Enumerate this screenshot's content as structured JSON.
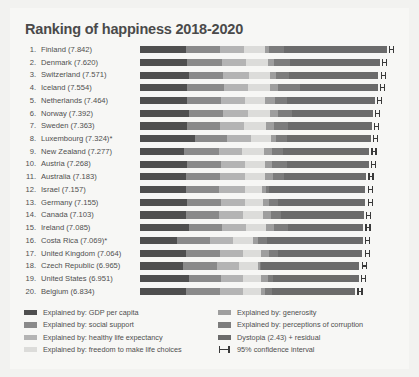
{
  "chart": {
    "title": "Ranking of happiness 2018-2020"
  },
  "chart_data": {
    "type": "bar",
    "subtype": "stacked-horizontal",
    "title": "Ranking of happiness 2018-2020",
    "xlabel": "",
    "ylabel": "",
    "xlim": [
      0,
      8.2
    ],
    "grid": false,
    "legend_position": "bottom",
    "categories": [
      "Finland",
      "Denmark",
      "Switzerland",
      "Iceland",
      "Netherlands",
      "Norway",
      "Sweden",
      "Luxembourg",
      "New Zealand",
      "Austria",
      "Australia",
      "Israel",
      "Germany",
      "Canada",
      "Ireland",
      "Costa Rica",
      "United Kingdom",
      "Czech Republic",
      "United States",
      "Belgium"
    ],
    "ranks": [
      1,
      2,
      3,
      4,
      5,
      6,
      7,
      8,
      9,
      10,
      11,
      12,
      13,
      14,
      15,
      16,
      17,
      18,
      19,
      20
    ],
    "row_labels": [
      "Finland (7.842)",
      "Denmark (7.620)",
      "Switzerland (7.571)",
      "Iceland (7.554)",
      "Netherlands (7.464)",
      "Norway (7.392)",
      "Sweden (7.363)",
      "Luxembourg (7.324)*",
      "New Zealand (7.277)",
      "Austria (7.268)",
      "Australia (7.183)",
      "Israel (7.157)",
      "Germany (7.155)",
      "Canada (7.103)",
      "Ireland (7.085)",
      "Costa Rica (7.069)*",
      "United Kingdom (7.064)",
      "Czech Republic (6.965)",
      "United States (6.951)",
      "Belgium (6.834)"
    ],
    "totals": [
      7.842,
      7.62,
      7.571,
      7.554,
      7.464,
      7.392,
      7.363,
      7.324,
      7.277,
      7.268,
      7.183,
      7.157,
      7.155,
      7.103,
      7.085,
      7.069,
      7.064,
      6.965,
      6.951,
      6.834
    ],
    "series": [
      {
        "name": "Explained by: GDP per capita",
        "color": "#4f4f4f",
        "values": [
          1.446,
          1.502,
          1.566,
          1.482,
          1.501,
          1.543,
          1.478,
          1.751,
          1.4,
          1.492,
          1.459,
          1.46,
          1.5,
          1.447,
          1.55,
          1.162,
          1.459,
          1.352,
          1.54,
          1.457
        ]
      },
      {
        "name": "Explained by: social support",
        "color": "#8a8a8a",
        "values": [
          1.106,
          1.108,
          1.079,
          1.172,
          1.079,
          1.108,
          1.062,
          1.003,
          1.094,
          1.07,
          1.095,
          1.061,
          1.067,
          1.064,
          1.066,
          1.066,
          1.07,
          1.089,
          1.047,
          1.07
        ]
      },
      {
        "name": "Explained by: healthy life expectancy",
        "color": "#b4b4b4",
        "values": [
          0.741,
          0.763,
          0.816,
          0.772,
          0.753,
          0.782,
          0.763,
          0.76,
          0.758,
          0.759,
          0.771,
          0.8,
          0.764,
          0.763,
          0.752,
          0.722,
          0.748,
          0.717,
          0.697,
          0.755
        ]
      },
      {
        "name": "Explained by: freedom to make life choices",
        "color": "#dcdcda",
        "values": [
          0.691,
          0.686,
          0.653,
          0.698,
          0.647,
          0.703,
          0.685,
          0.639,
          0.68,
          0.638,
          0.651,
          0.567,
          0.586,
          0.632,
          0.629,
          0.65,
          0.55,
          0.582,
          0.546,
          0.565
        ]
      },
      {
        "name": "Explained by: generosity",
        "color": "#9e9e9e",
        "values": [
          0.124,
          0.208,
          0.204,
          0.25,
          0.302,
          0.249,
          0.258,
          0.166,
          0.245,
          0.242,
          0.261,
          0.119,
          0.18,
          0.244,
          0.269,
          0.144,
          0.27,
          0.064,
          0.221,
          0.123
        ]
      },
      {
        "name": "Explained by: perceptions of corruption",
        "color": "#7c7c7c",
        "values": [
          0.481,
          0.485,
          0.413,
          0.718,
          0.384,
          0.427,
          0.448,
          0.353,
          0.361,
          0.481,
          0.343,
          0.098,
          0.273,
          0.322,
          0.427,
          0.294,
          0.285,
          0.038,
          0.169,
          0.215
        ]
      },
      {
        "name": "Dystopia (2.43) + residual",
        "color": "#6b6b6b",
        "values": [
          3.253,
          2.868,
          2.839,
          2.462,
          2.798,
          2.58,
          2.669,
          2.653,
          2.739,
          2.586,
          2.603,
          3.052,
          2.785,
          2.631,
          2.392,
          3.032,
          2.682,
          3.123,
          2.731,
          2.649
        ]
      }
    ],
    "confidence_interval": {
      "label": "95% confidence interval",
      "marker": "H"
    }
  },
  "legend": {
    "left": [
      {
        "label": "Explained by: GDP per capita",
        "color": "#4f4f4f"
      },
      {
        "label": "Explained by: social support",
        "color": "#8a8a8a"
      },
      {
        "label": "Explained by: healthy life expectancy",
        "color": "#b4b4b4"
      },
      {
        "label": "Explained by: freedom to make life choices",
        "color": "#dcdcda"
      }
    ],
    "right": [
      {
        "label": "Explained by: generosity",
        "color": "#9e9e9e"
      },
      {
        "label": "Explained by: perceptions of corruption",
        "color": "#7c7c7c"
      },
      {
        "label": "Dystopia (2.43) + residual",
        "color": "#6b6b6b"
      },
      {
        "label": "95% confidence interval",
        "color": "#3a3a3a",
        "icon": "confidence-interval-icon"
      }
    ]
  }
}
